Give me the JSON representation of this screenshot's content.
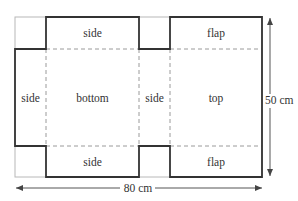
{
  "diagram": {
    "type": "box net (unfolded box pattern)",
    "panels": {
      "top_side": "side",
      "top_flap": "flap",
      "left_side": "side",
      "bottom": "bottom",
      "middle_side": "side",
      "top": "top",
      "bottom_side": "side",
      "bottom_flap": "flap"
    },
    "dimensions": {
      "height": "50 cm",
      "width": "80 cm"
    },
    "colors": {
      "cut_line": "#333333",
      "fold_line": "#9a9a9a",
      "waste_outline": "#b5b5b5",
      "arrow": "#555555"
    }
  }
}
